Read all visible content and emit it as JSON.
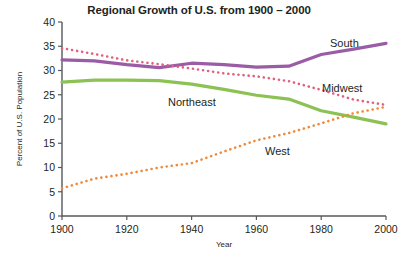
{
  "chart_data": {
    "type": "line",
    "title": "Regional Growth of U.S. from 1900 – 2000",
    "xlabel": "Year",
    "ylabel": "Percent of U.S. Population",
    "xlim": [
      1900,
      2000
    ],
    "ylim": [
      0,
      40
    ],
    "grid": false,
    "legend_position": "inline-labels",
    "x": [
      1900,
      1910,
      1920,
      1930,
      1940,
      1950,
      1960,
      1970,
      1980,
      1990,
      2000
    ],
    "xticks": [
      "1900",
      "1920",
      "1940",
      "1960",
      "1980",
      "2000"
    ],
    "yticks": [
      "0",
      "5",
      "10",
      "15",
      "20",
      "25",
      "30",
      "35",
      "40"
    ],
    "series": [
      {
        "name": "South",
        "color": "#9b5ca6",
        "style": "solid",
        "values": [
          32.2,
          32.0,
          31.2,
          30.6,
          31.5,
          31.2,
          30.7,
          30.9,
          33.3,
          34.4,
          35.6
        ]
      },
      {
        "name": "Midwest",
        "color": "#e0607e",
        "style": "dotted",
        "values": [
          34.6,
          33.4,
          32.1,
          31.3,
          30.4,
          29.4,
          28.8,
          27.8,
          26.0,
          24.0,
          22.9
        ]
      },
      {
        "name": "Northeast",
        "color": "#8cc153",
        "style": "solid",
        "values": [
          27.6,
          28.0,
          28.0,
          27.9,
          27.2,
          26.1,
          24.9,
          24.1,
          21.7,
          20.4,
          19.0
        ]
      },
      {
        "name": "West",
        "color": "#ef8a3c",
        "style": "dotted",
        "values": [
          5.7,
          7.7,
          8.7,
          10.0,
          10.9,
          13.3,
          15.6,
          17.1,
          19.1,
          21.2,
          22.5
        ]
      }
    ]
  }
}
